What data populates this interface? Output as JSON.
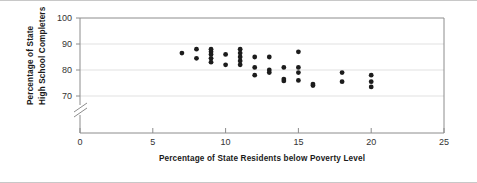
{
  "chart_data": {
    "type": "scatter",
    "title": "",
    "xlabel": "Percentage of State Residents below Poverty Level",
    "ylabel": "Percentage of State\nHigh School Completers",
    "ylabel_line1": "Percentage of State",
    "ylabel_line2": "High School Completers",
    "xlim": [
      0,
      25
    ],
    "ylim": [
      70,
      100
    ],
    "y_axis_broken": true,
    "y_break_note": "axis break below 70",
    "xticks": [
      0,
      5,
      10,
      15,
      20,
      25
    ],
    "xtick_labels": [
      "0",
      "5",
      "10",
      "15",
      "20",
      "25"
    ],
    "yticks": [
      70,
      80,
      90,
      100
    ],
    "ytick_labels": [
      "70",
      "80",
      "90",
      "100"
    ],
    "grid": "horizontal",
    "legend": "none",
    "marker": "filled-circle",
    "marker_color": "#1c1c1c",
    "points": [
      {
        "x": 7,
        "y": 86.5
      },
      {
        "x": 8,
        "y": 88.0
      },
      {
        "x": 8,
        "y": 84.5
      },
      {
        "x": 9,
        "y": 88.0
      },
      {
        "x": 9,
        "y": 87.0
      },
      {
        "x": 9,
        "y": 86.0
      },
      {
        "x": 9,
        "y": 84.5
      },
      {
        "x": 9,
        "y": 83.0
      },
      {
        "x": 10,
        "y": 86.0
      },
      {
        "x": 10,
        "y": 82.0
      },
      {
        "x": 11,
        "y": 88.0
      },
      {
        "x": 11,
        "y": 86.5
      },
      {
        "x": 11,
        "y": 85.0
      },
      {
        "x": 11,
        "y": 83.5
      },
      {
        "x": 11,
        "y": 82.0
      },
      {
        "x": 12,
        "y": 85.0
      },
      {
        "x": 12,
        "y": 81.0
      },
      {
        "x": 12,
        "y": 78.0
      },
      {
        "x": 13,
        "y": 85.0
      },
      {
        "x": 13,
        "y": 80.0
      },
      {
        "x": 13,
        "y": 79.0
      },
      {
        "x": 14,
        "y": 81.0
      },
      {
        "x": 14,
        "y": 76.5
      },
      {
        "x": 14,
        "y": 75.8
      },
      {
        "x": 15,
        "y": 87.0
      },
      {
        "x": 15,
        "y": 81.0
      },
      {
        "x": 15,
        "y": 79.0
      },
      {
        "x": 15,
        "y": 76.0
      },
      {
        "x": 16,
        "y": 74.6
      },
      {
        "x": 16,
        "y": 74.0
      },
      {
        "x": 18,
        "y": 79.0
      },
      {
        "x": 18,
        "y": 75.5
      },
      {
        "x": 20,
        "y": 78.0
      },
      {
        "x": 20,
        "y": 75.5
      },
      {
        "x": 20,
        "y": 73.5
      }
    ]
  }
}
